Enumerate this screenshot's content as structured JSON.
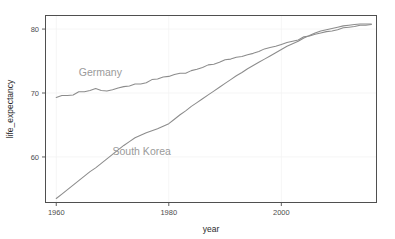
{
  "figure": {
    "background_color": "#ffffff",
    "clipped_top_text": "· ·",
    "panel": {
      "left": 45,
      "top": 15,
      "right": 377,
      "bottom": 203,
      "border_color": "#4f4f4f",
      "grid_color": "#f2f2f2"
    }
  },
  "axes": {
    "x": {
      "title": "year",
      "ticks": [
        1960,
        1980,
        2000
      ],
      "tick_labels": [
        "1960",
        "1980",
        "2000"
      ],
      "range": [
        1958,
        2017
      ]
    },
    "y": {
      "title": "life_expectancy",
      "ticks": [
        60,
        70,
        80
      ],
      "tick_labels": [
        "60",
        "70",
        "80"
      ],
      "range": [
        52.8,
        82.2
      ]
    }
  },
  "annotations": [
    {
      "name": "germany-label",
      "text": "Germany",
      "x": 1964.0,
      "y": 72.6,
      "color": "#9a9a9a"
    },
    {
      "name": "south-korea-label",
      "text": "South Korea",
      "x": 1970.0,
      "y": 60.3,
      "color": "#9a9a9a"
    }
  ],
  "chart_data": {
    "type": "line",
    "title": "",
    "xlabel": "year",
    "ylabel": "life_expectancy",
    "xlim": [
      1958,
      2017
    ],
    "ylim": [
      52.8,
      82.2
    ],
    "grid": true,
    "legend": "inline-labels",
    "x": [
      1960,
      1961,
      1962,
      1963,
      1964,
      1965,
      1966,
      1967,
      1968,
      1969,
      1970,
      1971,
      1972,
      1973,
      1974,
      1975,
      1976,
      1977,
      1978,
      1979,
      1980,
      1981,
      1982,
      1983,
      1984,
      1985,
      1986,
      1987,
      1988,
      1989,
      1990,
      1991,
      1992,
      1993,
      1994,
      1995,
      1996,
      1997,
      1998,
      1999,
      2000,
      2001,
      2002,
      2003,
      2004,
      2005,
      2006,
      2007,
      2008,
      2009,
      2010,
      2011,
      2012,
      2013,
      2014,
      2015,
      2016
    ],
    "series": [
      {
        "name": "Germany",
        "color": "#8c8c8c",
        "values": [
          69.3,
          69.6,
          69.6,
          69.7,
          70.2,
          70.2,
          70.4,
          70.7,
          70.4,
          70.3,
          70.5,
          70.8,
          71.0,
          71.1,
          71.4,
          71.4,
          71.6,
          72.1,
          72.2,
          72.5,
          72.6,
          72.9,
          73.1,
          73.1,
          73.5,
          73.7,
          74.0,
          74.4,
          74.5,
          74.8,
          75.2,
          75.3,
          75.6,
          75.7,
          76.0,
          76.2,
          76.5,
          76.9,
          77.1,
          77.3,
          77.6,
          77.9,
          78.1,
          78.3,
          78.8,
          78.9,
          79.2,
          79.4,
          79.6,
          79.7,
          79.9,
          80.2,
          80.3,
          80.4,
          80.6,
          80.6,
          80.7
        ]
      },
      {
        "name": "South Korea",
        "color": "#8c8c8c",
        "values": [
          53.5,
          54.2,
          54.9,
          55.6,
          56.3,
          57.0,
          57.7,
          58.3,
          59.0,
          59.7,
          60.4,
          61.1,
          61.8,
          62.4,
          63.0,
          63.4,
          63.8,
          64.1,
          64.4,
          64.8,
          65.2,
          65.9,
          66.6,
          67.2,
          67.9,
          68.5,
          69.1,
          69.7,
          70.3,
          70.9,
          71.5,
          72.1,
          72.7,
          73.2,
          73.8,
          74.3,
          74.8,
          75.3,
          75.8,
          76.3,
          76.8,
          77.3,
          77.7,
          78.1,
          78.6,
          79.0,
          79.4,
          79.7,
          79.9,
          80.1,
          80.3,
          80.5,
          80.6,
          80.7,
          80.8,
          80.8,
          80.8
        ]
      }
    ]
  }
}
